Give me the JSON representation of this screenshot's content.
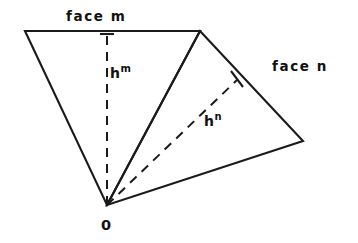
{
  "figure": {
    "background_color": "#ffffff",
    "line_color": "#1a1a1a",
    "width": 358,
    "height": 243
  },
  "labels": {
    "face_m": "face m",
    "face_n": "face n",
    "h_m_base": "h",
    "h_m_sup": "m",
    "h_n_base": "h",
    "h_n_sup": "n",
    "origin": "0"
  },
  "geometry": {
    "vertices": {
      "top_left": {
        "x": 25,
        "y": 31
      },
      "top_right": {
        "x": 200,
        "y": 31
      },
      "right": {
        "x": 303,
        "y": 141
      },
      "origin": {
        "x": 107,
        "y": 205
      }
    },
    "face_m_polygon": "25,31 200,31 107,205",
    "face_n_polygon": "200,31 303,141 107,205",
    "altitude_h_m": {
      "x1": 107,
      "y1": 205,
      "x2": 107,
      "y2": 31
    },
    "altitude_h_n": {
      "x1": 107,
      "y1": 205,
      "x2": 237,
      "y2": 80
    },
    "tick_h_m": {
      "x1": 100,
      "y1": 34,
      "x2": 114,
      "y2": 34
    },
    "tick_h_n": {
      "x1": 232,
      "y1": 72,
      "x2": 242,
      "y2": 86
    }
  }
}
